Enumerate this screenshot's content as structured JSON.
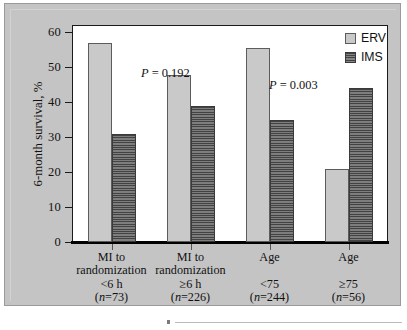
{
  "figure": {
    "panel_background": "#c4c4c4",
    "plot_background": "#ffffff"
  },
  "legend": {
    "position": "top-right",
    "entries": [
      {
        "label": "ERV",
        "color": "#c9c9c9",
        "pattern": "solid"
      },
      {
        "label": "IMS",
        "color": "#6f6f6f",
        "pattern": "horizontal-hatch"
      }
    ]
  },
  "annotations": [
    {
      "text": "P = 0.192",
      "p_italic": "P",
      "rest": " = 0.192"
    },
    {
      "text": "P = 0.003",
      "p_italic": "P",
      "rest": " = 0.003"
    }
  ],
  "axis": {
    "y_title": "6-month survival, %",
    "y_ticks": [
      "0",
      "10",
      "20",
      "30",
      "40",
      "50",
      "60"
    ]
  },
  "categories_detail": [
    {
      "line1": "MI to",
      "line2": "randomization",
      "line3": "<6 h",
      "n_prefix": "(",
      "n_label": "n",
      "n_value": "=73)"
    },
    {
      "line1": "MI to",
      "line2": "randomization",
      "line3": "≥6 h",
      "n_prefix": "(",
      "n_label": "n",
      "n_value": "=226)"
    },
    {
      "line1": "Age",
      "line2": "",
      "line3": "<75",
      "n_prefix": "(",
      "n_label": "n",
      "n_value": "=244)"
    },
    {
      "line1": "Age",
      "line2": "",
      "line3": "≥75",
      "n_prefix": "(",
      "n_label": "n",
      "n_value": "=56)"
    }
  ],
  "chart_data": {
    "type": "bar",
    "title": "",
    "subtitle": "",
    "xlabel": "",
    "ylabel": "6-month survival, %",
    "ylim": [
      0,
      62
    ],
    "ytick_values": [
      0,
      10,
      20,
      30,
      40,
      50,
      60
    ],
    "grid": false,
    "legend_position": "top-right",
    "categories": [
      "MI to randomization <6 h (n=73)",
      "MI to randomization ≥6 h (n=226)",
      "Age <75 (n=244)",
      "Age ≥75 (n=56)"
    ],
    "series": [
      {
        "name": "ERV",
        "color": "#c9c9c9",
        "values": [
          57.0,
          47.8,
          55.5,
          21.0
        ]
      },
      {
        "name": "IMS",
        "color": "#6f6f6f",
        "values": [
          31.0,
          39.0,
          35.0,
          44.0
        ]
      }
    ],
    "annotations": [
      {
        "text": "P = 0.192",
        "applies_to": [
          "MI to randomization <6 h (n=73)",
          "MI to randomization ≥6 h (n=226)"
        ]
      },
      {
        "text": "P = 0.003",
        "applies_to": [
          "Age <75 (n=244)",
          "Age ≥75 (n=56)"
        ]
      }
    ]
  }
}
